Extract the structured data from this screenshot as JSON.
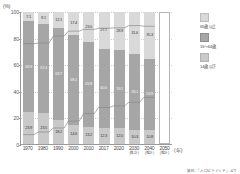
{
  "chart_data": {
    "type": "bar",
    "title": "",
    "subtitle": "",
    "xlabel": "(年)",
    "ylabel": "(%)",
    "ylim": [
      0,
      100
    ],
    "yticks": [
      "0",
      "20",
      "40",
      "60",
      "80",
      "100"
    ],
    "grid": true,
    "stacked": true,
    "legend_position": "right",
    "unit_top": "(%)",
    "categories": [
      "1970",
      "1980",
      "1990",
      "2000",
      "2010",
      "2017",
      "2020",
      "2030",
      "2040",
      "2050"
    ],
    "category_notes": [
      "",
      "",
      "",
      "",
      "",
      "",
      "",
      "(推計)",
      "(推計)",
      "(推計)"
    ],
    "series": [
      {
        "name": "65歳 以上",
        "color": "#d9d9d9",
        "values": [
          7.1,
          9.1,
          12.1,
          17.4,
          23.0,
          27.7,
          28.9,
          31.6,
          35.3,
          null
        ],
        "labels": [
          "7.1",
          "9.1",
          "12.1",
          "17.4",
          "23.0",
          "27.7",
          "28.9",
          "31.6",
          "35.3",
          ""
        ]
      },
      {
        "name": "15～64歳",
        "color": "#a6a6a6",
        "values": [
          68.9,
          67.4,
          69.7,
          68.1,
          63.8,
          60.0,
          59.1,
          58.1,
          53.9,
          null
        ],
        "labels": [
          "68.9",
          "67.4",
          "69.7",
          "68.1",
          "63.8",
          "60.0",
          "59.1",
          "58.1",
          "53.9",
          ""
        ]
      },
      {
        "name": "14歳 以下",
        "color": "#c9c9c9",
        "values": [
          23.9,
          23.5,
          18.2,
          14.6,
          13.2,
          12.3,
          12.0,
          10.3,
          10.8,
          null
        ],
        "labels": [
          "23.9",
          "23.5",
          "18.2",
          "14.6",
          "13.2",
          "12.3",
          "12.0",
          "10.3",
          "10.8",
          ""
        ]
      }
    ],
    "source": "資料：「人口ピラミッド」より"
  },
  "legend": {
    "items": [
      {
        "label": "65歳 以上",
        "swatch": "sw-old"
      },
      {
        "label": "15～64歳",
        "swatch": "sw-mid"
      },
      {
        "label": "14歳 以下",
        "swatch": "sw-young"
      }
    ]
  },
  "axis": {
    "unit": "(%)",
    "x_unit": "(年)"
  }
}
